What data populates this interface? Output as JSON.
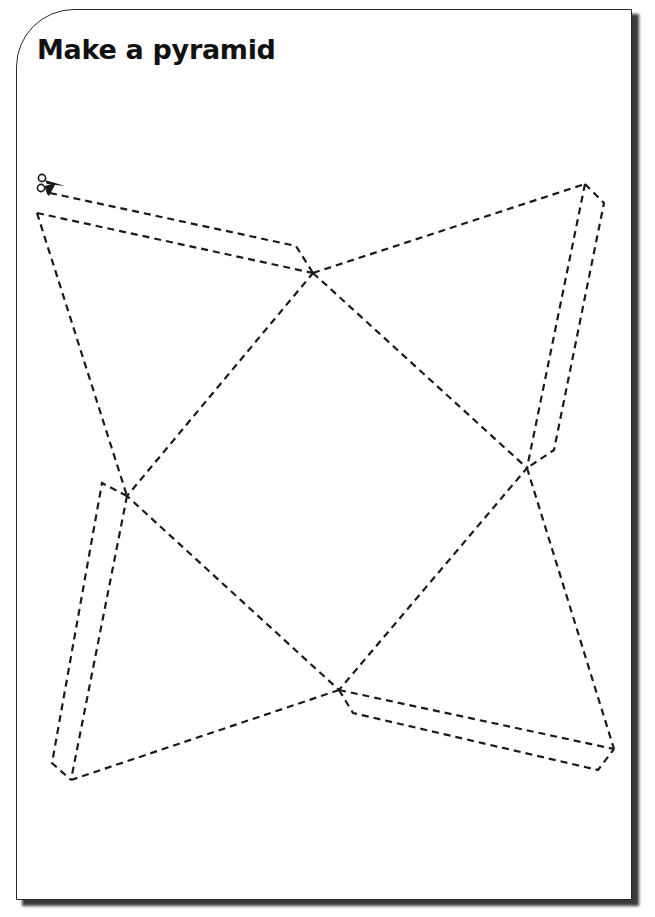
{
  "page": {
    "title": "Make a pyramid"
  },
  "icons": {
    "scissors": "scissors-icon"
  },
  "net": {
    "description": "Square-based pyramid net with four triangular faces and glue tabs, drawn with dashed cut lines",
    "square_vertices": {
      "top": [
        313,
        273
      ],
      "right": [
        527,
        468
      ],
      "bottom": [
        339,
        690
      ],
      "left": [
        127,
        496
      ]
    },
    "apexes": {
      "top_left": [
        37,
        213
      ],
      "top_right": [
        585,
        184
      ],
      "bottom_right": [
        614,
        749
      ],
      "bottom_left": [
        71,
        780
      ]
    },
    "line_color": "#1a1a1a",
    "border_color": "#2a2a2a"
  }
}
